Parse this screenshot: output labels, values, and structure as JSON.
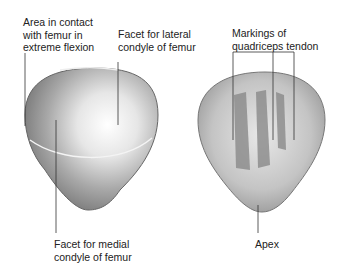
{
  "labels": {
    "area_contact": [
      "Area in contact",
      "with femur in",
      "extreme flexion"
    ],
    "lateral_facet": [
      "Facet for lateral",
      "condyle of femur"
    ],
    "medial_facet": [
      "Facet for medial",
      "condyle of femur"
    ],
    "quadriceps": [
      "Markings of",
      "quadriceps tendon"
    ],
    "apex": [
      "Apex"
    ]
  }
}
